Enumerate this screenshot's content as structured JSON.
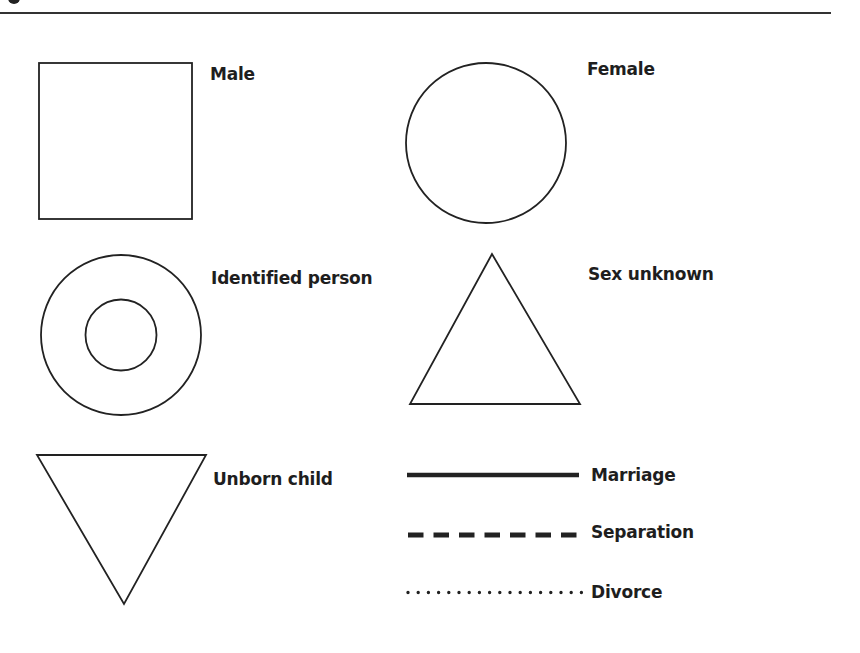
{
  "figure": {
    "symbols": [
      {
        "id": "male",
        "label": "Male",
        "shape": "square"
      },
      {
        "id": "female",
        "label": "Female",
        "shape": "circle"
      },
      {
        "id": "identified-person",
        "label": "Identified person",
        "shape": "double-circle"
      },
      {
        "id": "sex-unknown",
        "label": "Sex unknown",
        "shape": "triangle"
      },
      {
        "id": "unborn-child",
        "label": "Unborn child",
        "shape": "inverted-triangle"
      }
    ],
    "lines": [
      {
        "id": "marriage",
        "label": "Marriage",
        "style": "solid"
      },
      {
        "id": "separation",
        "label": "Separation",
        "style": "dashed"
      },
      {
        "id": "divorce",
        "label": "Divorce",
        "style": "dotted"
      }
    ]
  },
  "colors": {
    "stroke": "#222222",
    "background": "#ffffff"
  }
}
